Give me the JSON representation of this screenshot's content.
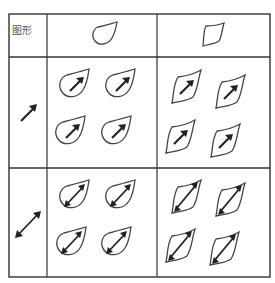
{
  "table": {
    "corner_label": "图形",
    "columns": [
      {
        "shape": "drop-shape-icon",
        "description": "teardrop shape, pointed top-right"
      },
      {
        "shape": "leaf-shape-icon",
        "description": "leaf/lens shape, pointed top-right and bottom-left"
      }
    ],
    "rows": [
      {
        "arrow": "single-arrow-icon",
        "description": "arrow pointing up-right"
      },
      {
        "arrow": "double-arrow-icon",
        "description": "double-headed diagonal arrow"
      }
    ],
    "cells_per_intersection": 4,
    "colors": {
      "line": "#333333",
      "arrow": "#222222",
      "shape_stroke": "#444444"
    }
  }
}
